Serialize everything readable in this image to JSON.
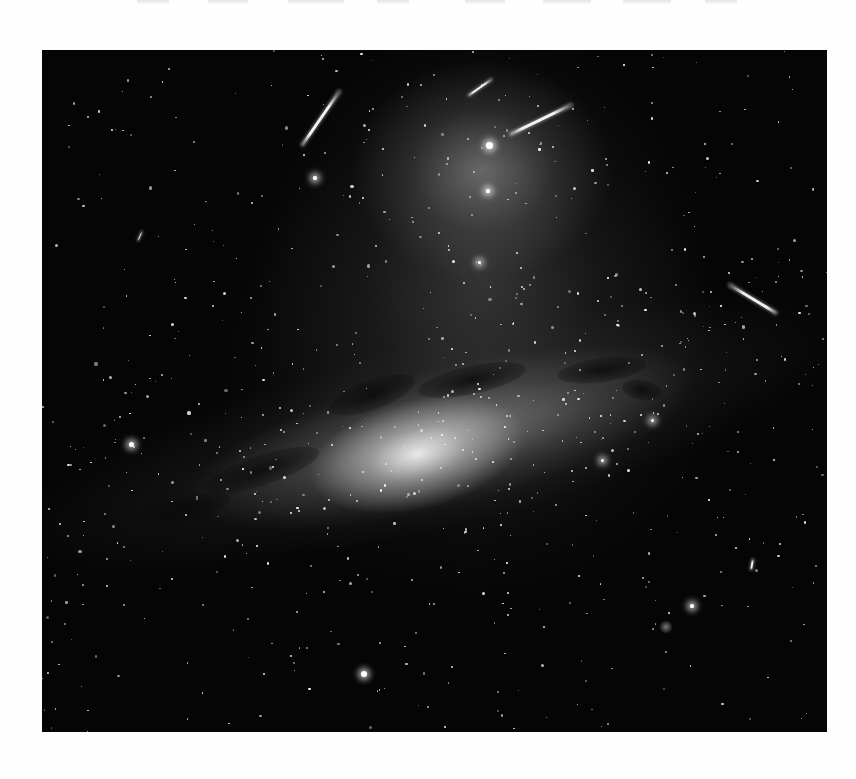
{
  "page": {
    "background": "#ffffff",
    "top_clipped_fragments": [
      {
        "x": 137,
        "w": 32
      },
      {
        "x": 208,
        "w": 40
      },
      {
        "x": 288,
        "w": 56
      },
      {
        "x": 377,
        "w": 32
      },
      {
        "x": 465,
        "w": 40
      },
      {
        "x": 543,
        "w": 48
      },
      {
        "x": 623,
        "w": 48
      },
      {
        "x": 705,
        "w": 32
      }
    ]
  },
  "photo": {
    "subject": "Milky Way galactic core with zodiacal light and satellite/meteor streaks",
    "colormode": "grayscale",
    "frame": {
      "x": 42,
      "y": 50,
      "width": 785,
      "height": 682
    },
    "bright_stars": [
      {
        "x": 447,
        "y": 95,
        "r": 3.5
      },
      {
        "x": 89,
        "y": 394,
        "r": 2.5
      },
      {
        "x": 322,
        "y": 624,
        "r": 3
      },
      {
        "x": 273,
        "y": 128,
        "r": 1.6
      },
      {
        "x": 446,
        "y": 141,
        "r": 1.6
      },
      {
        "x": 437,
        "y": 212,
        "r": 1.5
      },
      {
        "x": 650,
        "y": 556,
        "r": 1.6
      },
      {
        "x": 610,
        "y": 370,
        "r": 1.5
      },
      {
        "x": 560,
        "y": 410,
        "r": 1.5
      }
    ],
    "streaks": [
      {
        "name": "streak-top-left",
        "x1": 298,
        "y1": 40,
        "x2": 260,
        "y2": 95,
        "thickness": 3
      },
      {
        "name": "streak-top-center",
        "x1": 450,
        "y1": 29,
        "x2": 426,
        "y2": 46,
        "thickness": 2
      },
      {
        "name": "streak-top-right",
        "x1": 530,
        "y1": 54,
        "x2": 468,
        "y2": 84,
        "thickness": 3
      },
      {
        "name": "streak-right",
        "x1": 687,
        "y1": 234,
        "x2": 735,
        "y2": 263,
        "thickness": 2.5
      },
      {
        "name": "streak-faint-left",
        "x1": 100,
        "y1": 181,
        "x2": 96,
        "y2": 190,
        "thickness": 1
      },
      {
        "name": "streak-faint-right",
        "x1": 711,
        "y1": 509,
        "x2": 709,
        "y2": 520,
        "thickness": 2
      }
    ],
    "fuzzy_objects": [
      {
        "x": 624,
        "y": 577,
        "r": 7
      }
    ],
    "dust_lanes": [
      {
        "x": 330,
        "y": 345,
        "w": 90,
        "h": 30,
        "rot": -20
      },
      {
        "x": 430,
        "y": 330,
        "w": 110,
        "h": 28,
        "rot": -12
      },
      {
        "x": 560,
        "y": 320,
        "w": 90,
        "h": 24,
        "rot": -8
      },
      {
        "x": 220,
        "y": 420,
        "w": 120,
        "h": 30,
        "rot": -18
      },
      {
        "x": 140,
        "y": 460,
        "w": 100,
        "h": 26,
        "rot": -14
      },
      {
        "x": 600,
        "y": 340,
        "w": 40,
        "h": 20,
        "rot": 10
      }
    ],
    "starfield": {
      "count": 1400,
      "seed": 7
    }
  }
}
